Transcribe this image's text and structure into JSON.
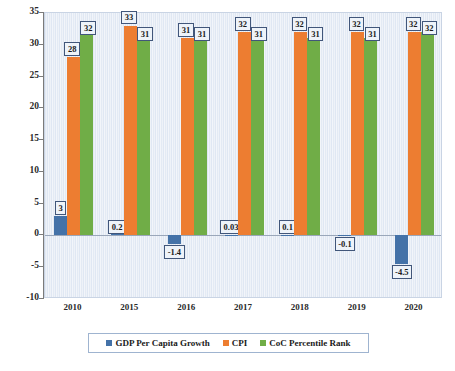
{
  "chart_data": {
    "type": "bar",
    "title": "",
    "xlabel": "",
    "ylabel": "",
    "ylim": [
      -10,
      35
    ],
    "yticks": [
      35,
      30,
      25,
      20,
      15,
      10,
      5,
      0,
      -5,
      -10
    ],
    "ytick_labels": [
      "35",
      "30",
      "25",
      "20",
      "15",
      "10",
      "5",
      "0",
      "-5",
      "-10"
    ],
    "grid": false,
    "legend_position": "bottom",
    "categories": [
      "2010",
      "2015",
      "2016",
      "2017",
      "2018",
      "2019",
      "2020"
    ],
    "series": [
      {
        "name": "GDP Per Capita Growth",
        "color": "#4472A8",
        "values": [
          3,
          0.2,
          -1.4,
          0.03,
          0.1,
          -0.1,
          -4.5
        ],
        "value_labels": [
          "3",
          "0.2",
          "-1.4",
          "0.03",
          "0.1",
          "-0.1",
          "-4.5"
        ]
      },
      {
        "name": "CPI",
        "color": "#ED7D31",
        "values": [
          28,
          33,
          31,
          32,
          32,
          32,
          32
        ],
        "value_labels": [
          "28",
          "33",
          "31",
          "32",
          "32",
          "32",
          "32"
        ]
      },
      {
        "name": "CoC Percentile Rank",
        "color": "#70AD47",
        "values": [
          32,
          31,
          31,
          31,
          31,
          31,
          32
        ],
        "value_labels": [
          "32",
          "31",
          "31",
          "31",
          "31",
          "31",
          "32"
        ]
      }
    ]
  },
  "legend": {
    "items": [
      {
        "label": "GDP Per Capita Growth",
        "color": "#4472A8"
      },
      {
        "label": "CPI",
        "color": "#ED7D31"
      },
      {
        "label": "CoC Percentile Rank",
        "color": "#70AD47"
      }
    ]
  },
  "colors": {
    "series_blue": "#4472A8",
    "series_orange": "#ED7D31",
    "series_green": "#70AD47",
    "plot_background": "#E6EDF6",
    "label_border": "#41567A",
    "axis": "#7B7B7B"
  }
}
